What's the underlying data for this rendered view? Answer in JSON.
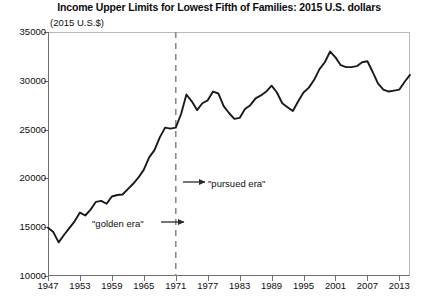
{
  "chart_data": {
    "type": "line",
    "title": "Income Upper Limits for Lowest Fifth of Families: 2015 U.S. dollars",
    "subtitle": "(2015 U.S.$)",
    "xlabel": "",
    "ylabel": "",
    "ylim": [
      10000,
      35000
    ],
    "xlim": [
      1947,
      2015
    ],
    "ytick_labels": [
      "10000",
      "15000",
      "20000",
      "25000",
      "30000",
      "35000"
    ],
    "ytick_values": [
      10000,
      15000,
      20000,
      25000,
      30000,
      35000
    ],
    "xtick_labels": [
      "1947",
      "1953",
      "1959",
      "1965",
      "1971",
      "1977",
      "1983",
      "1989",
      "1995",
      "2001",
      "2007",
      "2013"
    ],
    "xtick_values": [
      1947,
      1953,
      1959,
      1965,
      1971,
      1977,
      1983,
      1989,
      1995,
      2001,
      2007,
      2013
    ],
    "grid": false,
    "legend": "none",
    "line_color": "#1a1a1a",
    "x": [
      1947,
      1948,
      1949,
      1950,
      1951,
      1952,
      1953,
      1954,
      1955,
      1956,
      1957,
      1958,
      1959,
      1960,
      1961,
      1962,
      1963,
      1964,
      1965,
      1966,
      1967,
      1968,
      1969,
      1970,
      1971,
      1972,
      1973,
      1974,
      1975,
      1976,
      1977,
      1978,
      1979,
      1980,
      1981,
      1982,
      1983,
      1984,
      1985,
      1986,
      1987,
      1988,
      1989,
      1990,
      1991,
      1992,
      1993,
      1994,
      1995,
      1996,
      1997,
      1998,
      1999,
      2000,
      2001,
      2002,
      2003,
      2004,
      2005,
      2006,
      2007,
      2008,
      2009,
      2010,
      2011,
      2012,
      2013,
      2014,
      2015
    ],
    "values": [
      14950,
      14500,
      13450,
      14200,
      14900,
      15600,
      16500,
      16200,
      16800,
      17600,
      17700,
      17400,
      18150,
      18300,
      18350,
      18900,
      19450,
      20100,
      20900,
      22150,
      22900,
      24200,
      25200,
      25100,
      25200,
      26600,
      28600,
      27900,
      27000,
      27700,
      28000,
      28900,
      28700,
      27400,
      26700,
      26100,
      26200,
      27100,
      27500,
      28200,
      28500,
      28900,
      29500,
      28800,
      27700,
      27300,
      26900,
      27900,
      28800,
      29300,
      30100,
      31200,
      31900,
      33000,
      32400,
      31600,
      31400,
      31400,
      31500,
      31900,
      32000,
      30900,
      29700,
      29100,
      28900,
      29000,
      29100,
      29900,
      30600
    ],
    "annotations": [
      {
        "text": "\"golden era\"",
        "x_label": 1957,
        "has_arrow": true,
        "arrow_direction": "right",
        "points_to": 1971
      },
      {
        "text": "\"pursued era\"",
        "x_label": 1975,
        "has_arrow": true,
        "arrow_direction": "right",
        "points_from": 1971
      }
    ],
    "vline": {
      "x": 1971,
      "style": "dashed",
      "color": "#8a8a8a"
    }
  }
}
